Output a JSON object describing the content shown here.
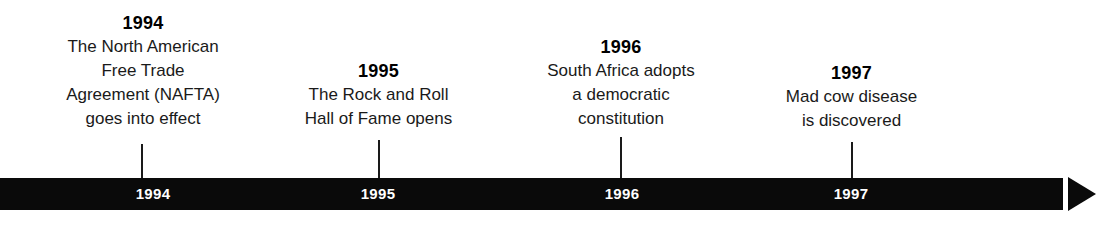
{
  "figure": {
    "type": "timeline",
    "title": "",
    "background_color": "#ffffff",
    "bar_color": "#0a0a0a",
    "text_color": "#111111",
    "bar_label_color": "#ffffff"
  },
  "timeline": {
    "arrow_direction": "right",
    "axis_labels": [
      "1994",
      "1995",
      "1996",
      "1997"
    ],
    "events": [
      {
        "year": "1994",
        "axis_label": "1994",
        "description_lines": [
          "The North American",
          "Free Trade",
          "Agreement (NAFTA)",
          "goes into effect"
        ]
      },
      {
        "year": "1995",
        "axis_label": "1995",
        "description_lines": [
          "The Rock and Roll",
          "Hall of Fame opens"
        ]
      },
      {
        "year": "1996",
        "axis_label": "1996",
        "description_lines": [
          "South Africa adopts",
          "a democratic",
          "constitution"
        ]
      },
      {
        "year": "1997",
        "axis_label": "1997",
        "description_lines": [
          "Mad cow disease",
          "is discovered"
        ]
      }
    ]
  }
}
